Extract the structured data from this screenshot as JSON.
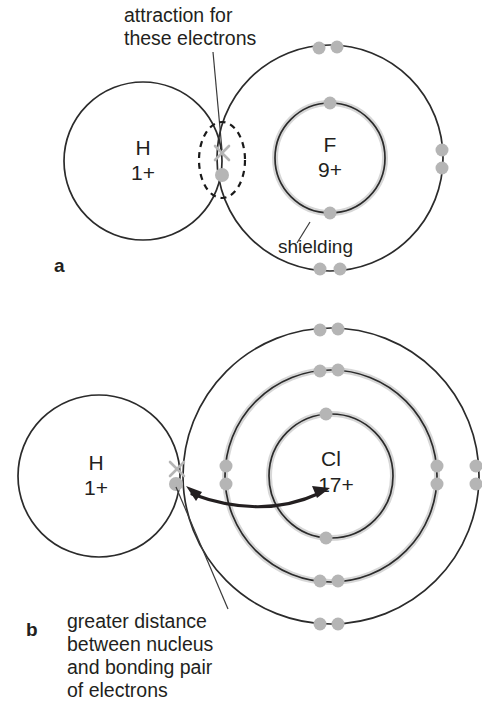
{
  "figure": {
    "colors": {
      "stroke": "#2b2b2b",
      "electron": "#b5b5b5",
      "shielding_glow": "#c9c9c9",
      "text": "#231f20",
      "background": "#ffffff"
    }
  },
  "panels": [
    {
      "label": "a",
      "molecule": "HF",
      "annotations": {
        "attraction": {
          "line1": "attraction for",
          "line2": "these electrons"
        },
        "shielding": "shielding"
      },
      "atoms": [
        {
          "name": "hydrogen",
          "symbol": "H",
          "charge": "1+",
          "shell_count": 1,
          "electrons_per_shell": [
            1
          ]
        },
        {
          "name": "fluorine",
          "symbol": "F",
          "charge": "9+",
          "shell_count": 2,
          "electrons_per_shell": [
            2,
            7
          ]
        }
      ],
      "bonding_pair": {
        "cross_symbol": "×",
        "dot_symbol": "●",
        "highlighted": true,
        "highlight_shape": "dashed-ellipse"
      }
    },
    {
      "label": "b",
      "molecule": "HCl",
      "annotations": {
        "distance": {
          "line1": "greater distance",
          "line2": "between nucleus",
          "line3": "and bonding pair",
          "line4": "of electrons"
        }
      },
      "atoms": [
        {
          "name": "hydrogen",
          "symbol": "H",
          "charge": "1+",
          "shell_count": 1,
          "electrons_per_shell": [
            1
          ]
        },
        {
          "name": "chlorine",
          "symbol": "Cl",
          "charge": "17+",
          "shell_count": 3,
          "electrons_per_shell": [
            2,
            8,
            7
          ]
        }
      ],
      "bonding_pair": {
        "cross_symbol": "×",
        "dot_symbol": "●",
        "highlighted": false
      },
      "distance_arrow": {
        "style": "double-headed-curved",
        "from": "bonding pair",
        "to": "chlorine nucleus"
      }
    }
  ]
}
